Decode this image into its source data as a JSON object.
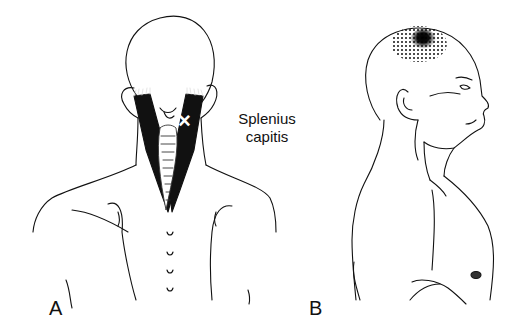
{
  "figure": {
    "muscle_name_line1": "Splenius",
    "muscle_name_line2": "capitis",
    "panels": [
      {
        "id": "A",
        "label": "A",
        "view": "posterior view of head, neck and shoulders with splenius capitis muscles shaded black and trigger point marked with X"
      },
      {
        "id": "B",
        "label": "B",
        "view": "lateral (side) view of head and torso with referred pain pattern stippled at the vertex of the skull"
      }
    ],
    "trigger_point_marker": "×",
    "colors": {
      "line": "#111111",
      "muscle_fill": "#111111",
      "background": "#ffffff"
    }
  }
}
